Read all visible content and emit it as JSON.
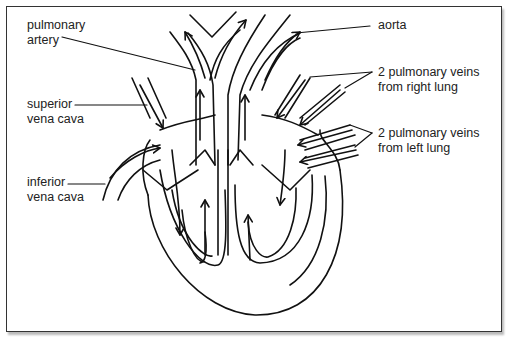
{
  "diagram": {
    "type": "heart-blood-flow",
    "labels": {
      "pulmonary_artery": [
        "pulmonary",
        "artery"
      ],
      "superior_vena_cava": [
        "superior",
        "vena cava"
      ],
      "inferior_vena_cava": [
        "inferior",
        "vena cava"
      ],
      "aorta": [
        "aorta"
      ],
      "pulmonary_veins_right": [
        "2 pulmonary veins",
        "from right lung"
      ],
      "pulmonary_veins_left": [
        "2 pulmonary veins",
        "from left lung"
      ]
    },
    "colors": {
      "line": "#111111",
      "text": "#222222",
      "border": "#333333",
      "background": "#ffffff"
    }
  }
}
